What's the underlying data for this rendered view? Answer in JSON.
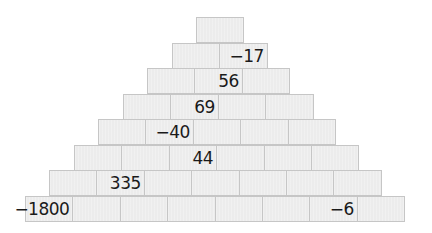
{
  "layout": {
    "cell_width": 48.4,
    "row_height": 25.5,
    "top": 17,
    "bottom_left": 25
  },
  "colors": {
    "cell_fill": "#ececec",
    "cell_border": "#c6c6c6",
    "text": "#1a1a1a"
  },
  "rows": [
    [
      "",
      "",
      "",
      "",
      "",
      "",
      "",
      ""
    ],
    [
      "",
      "-17"
    ],
    [
      "",
      "56",
      ""
    ],
    [
      "",
      "69",
      "",
      ""
    ],
    [
      "",
      "-40",
      "",
      "",
      ""
    ],
    [
      "",
      "",
      "44",
      "",
      "",
      ""
    ],
    [
      "",
      "335",
      "",
      "",
      "",
      "",
      ""
    ],
    [
      "-1800",
      "",
      "",
      "",
      "",
      "",
      "",
      ""
    ]
  ],
  "pyramid": {
    "row1": [
      ""
    ],
    "row2": [
      "",
      "−17"
    ],
    "row3": [
      "",
      "56",
      ""
    ],
    "row4": [
      "",
      "69",
      "",
      ""
    ],
    "row5": [
      "",
      "−40",
      "",
      "",
      ""
    ],
    "row6": [
      "",
      "",
      "44",
      "",
      "",
      ""
    ],
    "row7": [
      "",
      "335",
      "",
      "",
      "",
      "",
      ""
    ],
    "row8": [
      "−1800",
      "",
      "",
      "",
      "",
      "",
      "−6",
      ""
    ]
  }
}
